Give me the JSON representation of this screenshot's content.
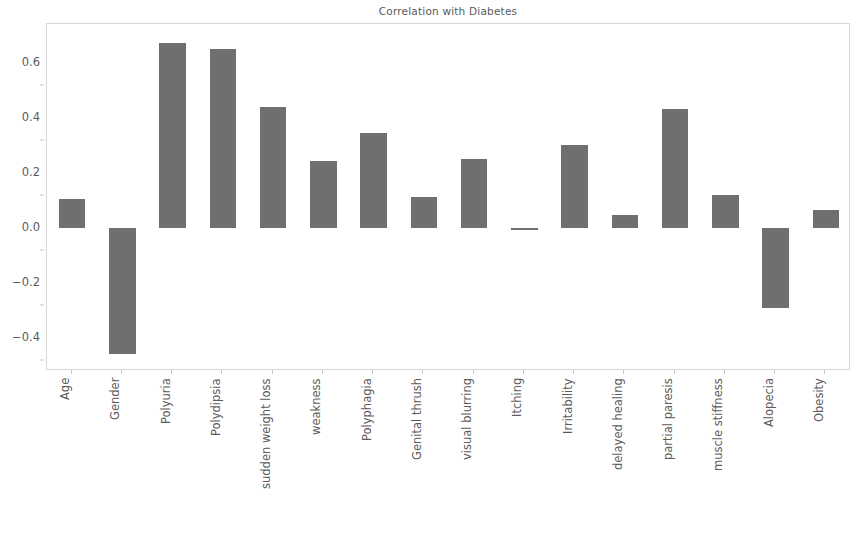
{
  "chart_data": {
    "type": "bar",
    "title": "Correlation with Diabetes",
    "xlabel": "",
    "ylabel": "",
    "grid": false,
    "legend": null,
    "bar_color": "#6f6f6f",
    "ylim": [
      -0.52,
      0.74
    ],
    "y_ticks": [
      "0.6",
      "0.4",
      "0.2",
      "0.0",
      "−0.2",
      "−0.4"
    ],
    "y_tick_values": [
      0.6,
      0.4,
      0.2,
      0.0,
      -0.2,
      -0.4
    ],
    "categories": [
      "Age",
      "Gender",
      "Polyuria",
      "Polydipsia",
      "sudden weight loss",
      "weakness",
      "Polyphagia",
      "Genital thrush",
      "visual blurring",
      "Itching",
      "Irritability",
      "delayed healing",
      "partial paresis",
      "muscle stiffness",
      "Alopecia",
      "Obesity"
    ],
    "values": [
      0.105,
      -0.46,
      0.67,
      0.65,
      0.44,
      0.244,
      0.343,
      0.111,
      0.251,
      -0.006,
      0.299,
      0.045,
      0.432,
      0.12,
      -0.29,
      0.065
    ]
  }
}
